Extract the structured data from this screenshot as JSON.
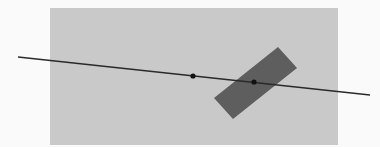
{
  "diagram": {
    "canvas": {
      "width": 380,
      "height": 147,
      "background": "#fafafa"
    },
    "plane": {
      "x": 50,
      "y": 8,
      "width": 288,
      "height": 137,
      "color": "#c9c9c9"
    },
    "rotated_rect": {
      "points": [
        [
          278,
          47
        ],
        [
          297,
          68
        ],
        [
          233,
          119
        ],
        [
          214,
          98
        ]
      ],
      "color": "#5e5e5e"
    },
    "line": {
      "x1": 18,
      "y1": 57,
      "x2": 370,
      "y2": 95,
      "color": "#2a2a2a",
      "width": 1.4
    },
    "points": [
      {
        "cx": 193,
        "cy": 76,
        "r": 2.6,
        "color": "#111111"
      },
      {
        "cx": 254,
        "cy": 82,
        "r": 2.6,
        "color": "#111111"
      }
    ]
  }
}
